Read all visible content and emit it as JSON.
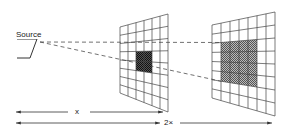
{
  "diagram": {
    "labels": {
      "source": "Source",
      "distance_1": "x",
      "distance_2": "2×"
    },
    "source_point": [
      40,
      42
    ],
    "grids": [
      {
        "name": "grid-at-x",
        "corners": {
          "tl": [
            120,
            27
          ],
          "tr": [
            168,
            14
          ],
          "br": [
            168,
            112
          ],
          "bl": [
            120,
            93
          ]
        },
        "cols": 6,
        "rows": 8,
        "shaded": {
          "col_start": 2,
          "col_end": 4,
          "row_start": 3,
          "row_end": 5
        },
        "shade_color": "#333333"
      },
      {
        "name": "grid-at-2x",
        "corners": {
          "tl": [
            212,
            25
          ],
          "tr": [
            275,
            12
          ],
          "br": [
            275,
            116
          ],
          "bl": [
            212,
            98
          ]
        },
        "cols": 7,
        "rows": 8,
        "shaded": {
          "col_start": 1,
          "col_end": 5,
          "row_start": 2,
          "row_end": 6
        },
        "shade_color": "#777777"
      }
    ],
    "colors": {
      "line": "#333333",
      "grid": "#444444"
    }
  }
}
